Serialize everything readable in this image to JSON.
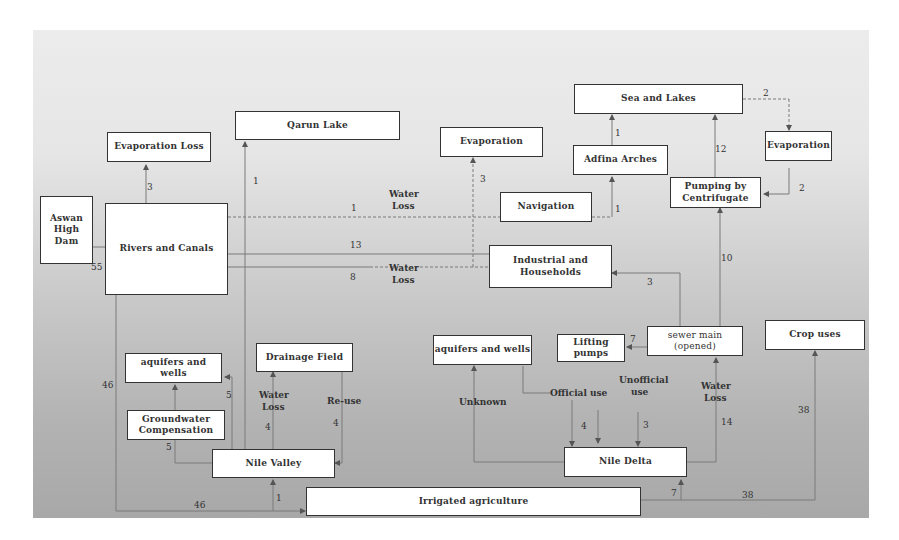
{
  "diagram": {
    "colors": {
      "box_fill": "#ffffff",
      "box_border": "#333333",
      "line": "#777777",
      "bg_top": "#ececec",
      "bg_bottom": "#a8a8a8"
    },
    "nodes": {
      "aswan": "Aswan High Dam",
      "rivers": "Rivers and Canals",
      "evap_loss": "Evaporation Loss",
      "qarun": "Qarun Lake",
      "evaporation_mid": "Evaporation",
      "sea_lakes": "Sea and Lakes",
      "adfina": "Adfina Arches",
      "evaporation_right": "Evaporation",
      "pumping": "Pumping by Centrifugate",
      "navigation": "Navigation",
      "industrial": "Industrial and Households",
      "aquifers_left": "aquifers and wells",
      "drainage": "Drainage Field",
      "groundwater": "Groundwater Compensation",
      "nile_valley": "Nile Valley",
      "aquifers_right": "aquifers and wells",
      "lifting": "Lifting pumps",
      "sewer": "sewer main (opened)",
      "crop": "Crop uses",
      "nile_delta": "Nile Delta",
      "irrigated": "Irrigated agriculture"
    },
    "labels": {
      "aswan_rivers": "55",
      "rivers_evap": "3",
      "qarun": "1",
      "nav_num": "1",
      "nav_text1": "Water",
      "nav_text2": "Loss",
      "ind_13": "13",
      "ind_8": "8",
      "ind_text1": "Water",
      "ind_text2": "Loss",
      "evap_mid": "3",
      "adfina_sea": "1",
      "nav_adfina": "1",
      "sea_evap": "2",
      "evap_pump": "2",
      "pump_sea": "12",
      "sewer_pump": "10",
      "sewer_ind": "3",
      "sewer_lifting": "7",
      "rivers_irr_46a": "46",
      "rivers_irr_46b": "46",
      "gw_aquifers": "5",
      "nv_aquifers": "5",
      "nv_drain_text1": "Water",
      "nv_drain_text2": "Loss",
      "nv_drain_num": "4",
      "reuse_text": "Re-use",
      "reuse_num": "4",
      "irr_nv": "1",
      "unknown": "Unknown",
      "official": "Official use",
      "unofficial1": "Unofficial",
      "unofficial2": "use",
      "official_num": "4",
      "unofficial_num": "3",
      "delta_sewer_text1": "Water",
      "delta_sewer_text2": "Loss",
      "delta_sewer_num": "14",
      "irr_delta": "7",
      "crop_num_v": "38",
      "crop_num_h": "38"
    }
  }
}
